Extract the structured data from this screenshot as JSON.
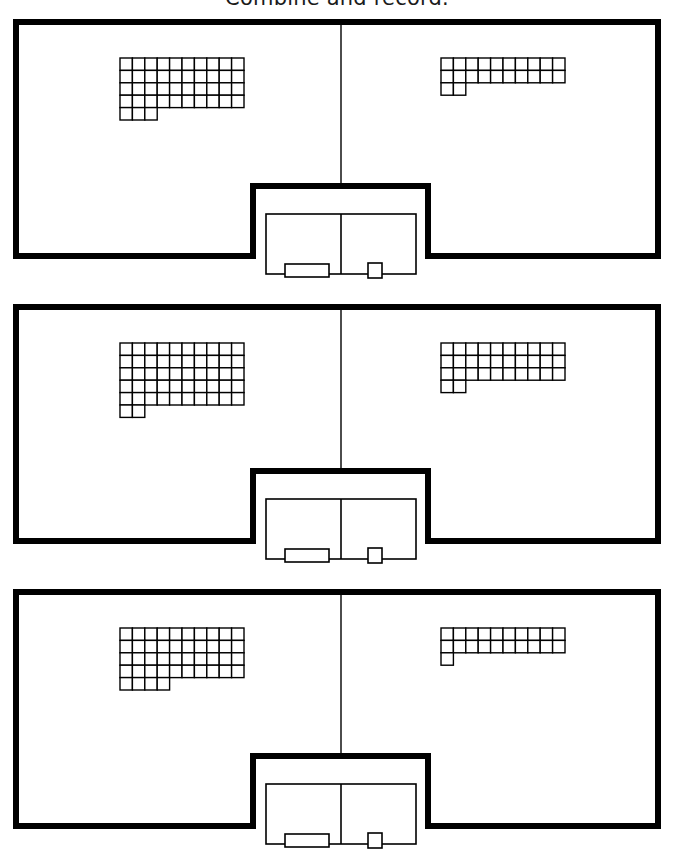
{
  "title": "Combine and record.",
  "page": {
    "width": 674,
    "height": 851,
    "background": "#ffffff",
    "ink": "#000000"
  },
  "answer_box": {
    "cells": [
      "",
      ""
    ],
    "left_label_box": "",
    "right_label_box": "",
    "left_cell_placeholder": "",
    "right_cell_placeholder": ""
  },
  "chart_data": {
    "type": "table",
    "title": "Combine and record.",
    "columns": [
      "problem",
      "left_addend_tens",
      "left_addend_ones",
      "left_addend_total",
      "right_addend_tens",
      "right_addend_ones",
      "right_addend_total",
      "sum"
    ],
    "rows": [
      [
        1,
        4,
        3,
        43,
        2,
        2,
        22,
        65
      ],
      [
        2,
        5,
        2,
        52,
        3,
        2,
        32,
        84
      ],
      [
        3,
        4,
        4,
        44,
        2,
        1,
        21,
        65
      ]
    ]
  },
  "problems": [
    {
      "index": 1,
      "left_shape": {
        "full_rows": 4,
        "row_width": 10,
        "partial_row_cells": 3,
        "tens": 4,
        "ones": 3,
        "total": 43
      },
      "right_shape": {
        "full_rows": 2,
        "row_width": 10,
        "partial_row_cells": 2,
        "tens": 2,
        "ones": 2,
        "total": 22
      },
      "answer_left": "",
      "answer_right": ""
    },
    {
      "index": 2,
      "left_shape": {
        "full_rows": 5,
        "row_width": 10,
        "partial_row_cells": 2,
        "tens": 5,
        "ones": 2,
        "total": 52
      },
      "right_shape": {
        "full_rows": 3,
        "row_width": 10,
        "partial_row_cells": 2,
        "tens": 3,
        "ones": 2,
        "total": 32
      },
      "answer_left": "",
      "answer_right": ""
    },
    {
      "index": 3,
      "left_shape": {
        "full_rows": 4,
        "row_width": 10,
        "partial_row_cells": 4,
        "tens": 4,
        "ones": 4,
        "total": 44
      },
      "right_shape": {
        "full_rows": 2,
        "row_width": 10,
        "partial_row_cells": 1,
        "tens": 2,
        "ones": 1,
        "total": 21
      },
      "answer_left": "",
      "answer_right": ""
    }
  ]
}
